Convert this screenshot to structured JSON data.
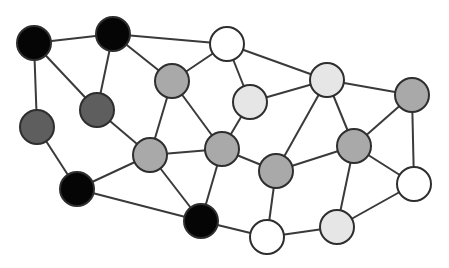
{
  "diagram": {
    "type": "network-graph",
    "node_radius": 17,
    "colors": {
      "black": "#050505",
      "darkgray": "#5e5e5e",
      "gray": "#a9a9a9",
      "lightgray": "#e6e6e6",
      "white": "#ffffff",
      "stroke": "#2e2e2e",
      "edge": "#3a3a3a"
    },
    "nodes": [
      {
        "id": "A",
        "x": 34,
        "y": 43,
        "fill": "black"
      },
      {
        "id": "B",
        "x": 113,
        "y": 34,
        "fill": "black"
      },
      {
        "id": "C",
        "x": 227,
        "y": 44,
        "fill": "white"
      },
      {
        "id": "D",
        "x": 327,
        "y": 80,
        "fill": "lightgray"
      },
      {
        "id": "E",
        "x": 412,
        "y": 95,
        "fill": "gray"
      },
      {
        "id": "F",
        "x": 172,
        "y": 81,
        "fill": "gray"
      },
      {
        "id": "G",
        "x": 250,
        "y": 102,
        "fill": "lightgray"
      },
      {
        "id": "H",
        "x": 97,
        "y": 110,
        "fill": "darkgray"
      },
      {
        "id": "I",
        "x": 37,
        "y": 127,
        "fill": "darkgray"
      },
      {
        "id": "J",
        "x": 150,
        "y": 155,
        "fill": "gray"
      },
      {
        "id": "K",
        "x": 222,
        "y": 149,
        "fill": "gray"
      },
      {
        "id": "L",
        "x": 354,
        "y": 146,
        "fill": "gray"
      },
      {
        "id": "M",
        "x": 276,
        "y": 171,
        "fill": "gray"
      },
      {
        "id": "N",
        "x": 77,
        "y": 189,
        "fill": "black"
      },
      {
        "id": "O",
        "x": 201,
        "y": 221,
        "fill": "black"
      },
      {
        "id": "P",
        "x": 267,
        "y": 237,
        "fill": "white"
      },
      {
        "id": "Q",
        "x": 337,
        "y": 227,
        "fill": "lightgray"
      },
      {
        "id": "R",
        "x": 414,
        "y": 184,
        "fill": "white"
      }
    ],
    "edges": [
      [
        "A",
        "B"
      ],
      [
        "A",
        "H"
      ],
      [
        "A",
        "I"
      ],
      [
        "B",
        "H"
      ],
      [
        "B",
        "F"
      ],
      [
        "B",
        "C"
      ],
      [
        "C",
        "F"
      ],
      [
        "C",
        "G"
      ],
      [
        "C",
        "D"
      ],
      [
        "D",
        "G"
      ],
      [
        "D",
        "M"
      ],
      [
        "D",
        "L"
      ],
      [
        "D",
        "E"
      ],
      [
        "E",
        "L"
      ],
      [
        "E",
        "R"
      ],
      [
        "F",
        "J"
      ],
      [
        "F",
        "K"
      ],
      [
        "G",
        "K"
      ],
      [
        "H",
        "J"
      ],
      [
        "I",
        "N"
      ],
      [
        "J",
        "N"
      ],
      [
        "J",
        "K"
      ],
      [
        "J",
        "O"
      ],
      [
        "N",
        "O"
      ],
      [
        "K",
        "O"
      ],
      [
        "K",
        "M"
      ],
      [
        "M",
        "L"
      ],
      [
        "M",
        "P"
      ],
      [
        "L",
        "Q"
      ],
      [
        "L",
        "R"
      ],
      [
        "Q",
        "P"
      ],
      [
        "Q",
        "R"
      ],
      [
        "O",
        "P"
      ]
    ]
  }
}
